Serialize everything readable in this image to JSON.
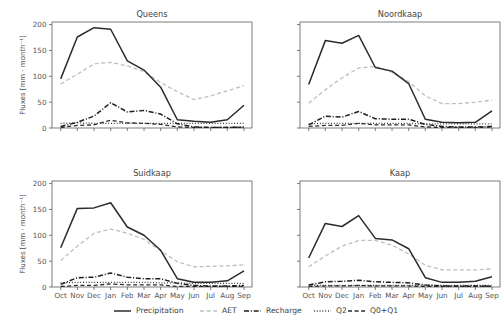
{
  "figure": {
    "ylabel": "Fluxes [mm · month⁻¹]",
    "ytick_labels": [
      "0",
      "50",
      "100",
      "150",
      "200"
    ],
    "ytick_values": [
      0,
      50,
      100,
      150,
      200
    ],
    "ylim": [
      0,
      205
    ],
    "xtick_labels": [
      "Oct",
      "Nov",
      "Dec",
      "Jan",
      "Feb",
      "Mar",
      "Apr",
      "May",
      "Jun",
      "Jul",
      "Aug",
      "Sep"
    ],
    "grid": false,
    "background_color": "#ffffff",
    "axis_color": "#5c5c5c"
  },
  "legend": {
    "position": "bottom-center",
    "entries": [
      {
        "label": "Precipitation",
        "style": "solid",
        "color": "#2b2b2b",
        "width": 1.5
      },
      {
        "label": "AET",
        "style": "dashed",
        "color": "#bfbfbf",
        "width": 1.3
      },
      {
        "label": "Recharge",
        "style": "dashdot",
        "color": "#1f1f1f",
        "width": 1.5
      },
      {
        "label": "Q2",
        "style": "dotted",
        "color": "#2b2b2b",
        "width": 1.3
      },
      {
        "label": "Q0+Q1",
        "style": "dashed",
        "color": "#2b2b2b",
        "width": 1.3
      }
    ]
  },
  "chart_data": {
    "type": "line",
    "title": "",
    "xlabel": "",
    "ylabel": "Fluxes [mm · month⁻¹]",
    "ylim": [
      0,
      205
    ],
    "categories": [
      "Oct",
      "Nov",
      "Dec",
      "Jan",
      "Feb",
      "Mar",
      "Apr",
      "May",
      "Jun",
      "Jul",
      "Aug",
      "Sep"
    ],
    "panels": [
      {
        "title": "Queens",
        "row": 0,
        "col": 0,
        "series": [
          {
            "name": "Precipitation",
            "values": [
              95,
              176,
              194,
              191,
              130,
              112,
              79,
              16,
              13,
              11,
              16,
              44
            ]
          },
          {
            "name": "AET",
            "values": [
              85,
              104,
              124,
              127,
              120,
              109,
              88,
              70,
              55,
              62,
              72,
              82
            ]
          },
          {
            "name": "Recharge",
            "values": [
              3,
              11,
              23,
              49,
              31,
              34,
              27,
              8,
              2,
              1,
              1,
              2
            ]
          },
          {
            "name": "Q2",
            "values": [
              9,
              10,
              9,
              9,
              9,
              9,
              9,
              9,
              9,
              9,
              9,
              9
            ]
          },
          {
            "name": "Q0+Q1",
            "values": [
              1,
              5,
              6,
              15,
              10,
              9,
              7,
              2,
              1,
              1,
              1,
              1
            ]
          }
        ]
      },
      {
        "title": "Noordkaap",
        "row": 0,
        "col": 1,
        "series": [
          {
            "name": "Precipitation",
            "values": [
              84,
              169,
              164,
              179,
              117,
              110,
              86,
              17,
              11,
              10,
              11,
              33
            ]
          },
          {
            "name": "AET",
            "values": [
              48,
              74,
              97,
              116,
              119,
              108,
              90,
              62,
              47,
              47,
              50,
              54
            ]
          },
          {
            "name": "Recharge",
            "values": [
              6,
              23,
              21,
              32,
              18,
              17,
              17,
              7,
              3,
              2,
              2,
              3
            ]
          },
          {
            "name": "Q2",
            "values": [
              8,
              9,
              9,
              9,
              9,
              9,
              9,
              8,
              8,
              8,
              8,
              8
            ]
          },
          {
            "name": "Q0+Q1",
            "values": [
              3,
              5,
              5,
              9,
              6,
              6,
              6,
              2,
              1,
              1,
              1,
              2
            ]
          }
        ]
      },
      {
        "title": "Suidkaap",
        "row": 1,
        "col": 0,
        "series": [
          {
            "name": "Precipitation",
            "values": [
              76,
              152,
              153,
              163,
              116,
              100,
              71,
              16,
              9,
              9,
              12,
              31
            ]
          },
          {
            "name": "AET",
            "values": [
              51,
              79,
              104,
              112,
              104,
              92,
              70,
              49,
              39,
              40,
              41,
              43
            ]
          },
          {
            "name": "Recharge",
            "values": [
              5,
              18,
              19,
              27,
              19,
              16,
              16,
              7,
              3,
              2,
              2,
              3
            ]
          },
          {
            "name": "Q2",
            "values": [
              8,
              9,
              9,
              9,
              9,
              9,
              8,
              8,
              7,
              7,
              7,
              7
            ]
          },
          {
            "name": "Q0+Q1",
            "values": [
              1,
              3,
              3,
              6,
              4,
              4,
              4,
              1,
              1,
              1,
              1,
              1
            ]
          }
        ]
      },
      {
        "title": "Kaap",
        "row": 1,
        "col": 1,
        "series": [
          {
            "name": "Precipitation",
            "values": [
              56,
              123,
              117,
              138,
              94,
              91,
              74,
              18,
              9,
              9,
              11,
              20
            ]
          },
          {
            "name": "AET",
            "values": [
              39,
              60,
              79,
              90,
              90,
              81,
              64,
              42,
              33,
              33,
              33,
              35
            ]
          },
          {
            "name": "Recharge",
            "values": [
              4,
              10,
              11,
              13,
              10,
              9,
              8,
              4,
              2,
              2,
              2,
              2
            ]
          },
          {
            "name": "Q2",
            "values": [
              3,
              3,
              3,
              3,
              3,
              3,
              3,
              3,
              3,
              3,
              3,
              3
            ]
          },
          {
            "name": "Q0+Q1",
            "values": [
              1,
              2,
              2,
              3,
              2,
              2,
              2,
              1,
              1,
              1,
              1,
              1
            ]
          }
        ]
      }
    ]
  }
}
